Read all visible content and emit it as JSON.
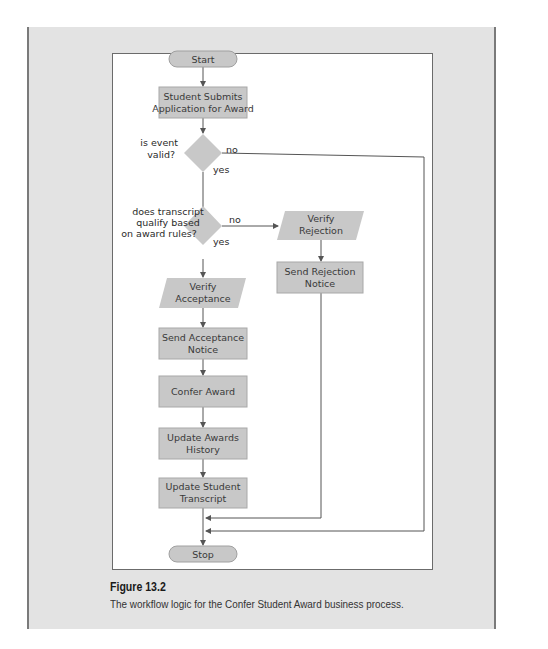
{
  "figure": {
    "title": "Figure 13.2",
    "caption": "The workflow logic for the Confer Student Award business process."
  },
  "colors": {
    "panel_bg": "#e3e3e3",
    "node_fill": "#c8c8c8",
    "node_stroke": "#a0a0a0",
    "line": "#555555"
  },
  "nodes": {
    "start": {
      "type": "terminator",
      "label": "Start"
    },
    "submit": {
      "type": "process",
      "line1": "Student Submits",
      "line2": "Application for Award"
    },
    "decision_valid": {
      "type": "decision",
      "line1": "is event",
      "line2": "valid?",
      "yes": "yes",
      "no": "no"
    },
    "decision_qualify": {
      "type": "decision",
      "line1": "does transcript",
      "line2": "qualify based",
      "line3": "on award rules?",
      "yes": "yes",
      "no": "no"
    },
    "verify_rejection": {
      "type": "io",
      "line1": "Verify",
      "line2": "Rejection"
    },
    "send_rejection": {
      "type": "process",
      "line1": "Send Rejection",
      "line2": "Notice"
    },
    "verify_acceptance": {
      "type": "io",
      "line1": "Verify",
      "line2": "Acceptance"
    },
    "send_acceptance": {
      "type": "process",
      "line1": "Send Acceptance",
      "line2": "Notice"
    },
    "confer_award": {
      "type": "process",
      "label": "Confer Award"
    },
    "update_history": {
      "type": "process",
      "line1": "Update Awards",
      "line2": "History"
    },
    "update_transcript": {
      "type": "process",
      "line1": "Update Student",
      "line2": "Transcript"
    },
    "stop": {
      "type": "terminator",
      "label": "Stop"
    }
  }
}
